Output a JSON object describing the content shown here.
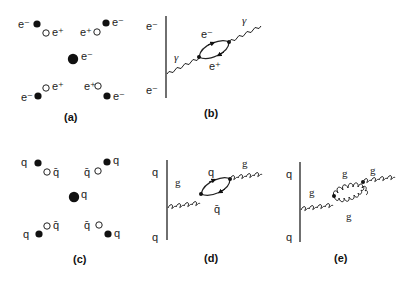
{
  "panels": {
    "a": {
      "caption": "(a)",
      "center_label": "e⁻",
      "pairs": [
        {
          "filled_label": "e⁻",
          "open_label": "e⁺"
        },
        {
          "filled_label": "e⁻",
          "open_label": "e⁺"
        },
        {
          "filled_label": "e⁻",
          "open_label": "e⁺"
        },
        {
          "filled_label": "e⁻",
          "open_label": "e⁺"
        }
      ]
    },
    "b": {
      "caption": "(b)",
      "line_top": "e⁻",
      "line_bottom": "e⁻",
      "boson_in": "γ",
      "boson_out": "γ",
      "loop_top": "e⁻",
      "loop_bottom": "e⁺"
    },
    "c": {
      "caption": "(c)",
      "center_label": "q",
      "pairs": [
        {
          "filled_label": "q",
          "open_label": "q̄"
        },
        {
          "filled_label": "q",
          "open_label": "q̄"
        },
        {
          "filled_label": "q",
          "open_label": "q̄"
        },
        {
          "filled_label": "q",
          "open_label": "q̄"
        }
      ]
    },
    "d": {
      "caption": "(d)",
      "line_top": "q",
      "line_bottom": "q",
      "boson_in": "g",
      "boson_out": "g",
      "loop_top": "q",
      "loop_bottom": "q̄"
    },
    "e": {
      "caption": "(e)",
      "line_top": "q",
      "line_bottom": "q",
      "boson_in": "g",
      "boson_out": "g",
      "loop_top": "g",
      "loop_bottom": "g"
    }
  }
}
